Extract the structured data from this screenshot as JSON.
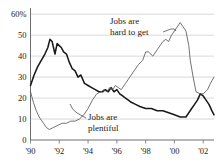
{
  "chart_data": {
    "type": "line",
    "title": "",
    "subtitle": "",
    "xlabel": "",
    "ylabel": "",
    "xlim": [
      1990,
      2002.75
    ],
    "ylim": [
      0,
      62
    ],
    "grid": true,
    "grid_axis": "y",
    "legend_position": "inline-annotations",
    "ytick_labels": [
      "60%",
      "50",
      "40",
      "30",
      "20",
      "10",
      "0"
    ],
    "ytick_values": [
      60,
      50,
      40,
      30,
      20,
      10,
      0
    ],
    "xtick_labels": [
      "'90",
      "'92",
      "'94",
      "'96",
      "'98",
      "'00",
      "'02"
    ],
    "xtick_values": [
      1990,
      1992,
      1994,
      1996,
      1998,
      2000,
      2002
    ],
    "annotations": [
      {
        "id": "hard-to-get",
        "text_line1": "Jobs are",
        "text_line2": "hard to get",
        "points_to_series": "Jobs are hard to get"
      },
      {
        "id": "plentiful",
        "text_line1": "Jobs are",
        "text_line2": "plentiful",
        "points_to_series": "Jobs are plentiful"
      }
    ],
    "series": [
      {
        "name": "Jobs are hard to get",
        "style": "bold",
        "color": "#1a1a1a",
        "x": [
          1990.0,
          1990.25,
          1990.5,
          1990.75,
          1991.0,
          1991.2,
          1991.35,
          1991.5,
          1991.7,
          1991.85,
          1992.0,
          1992.15,
          1992.3,
          1992.5,
          1992.7,
          1992.9,
          1993.1,
          1993.3,
          1993.5,
          1993.75,
          1994.0,
          1994.25,
          1994.5,
          1994.75,
          1995.0,
          1995.2,
          1995.4,
          1995.6,
          1995.8,
          1996.0,
          1996.2,
          1996.4,
          1996.6,
          1996.8,
          1997.0,
          1997.3,
          1997.6,
          1998.0,
          1998.4,
          1998.8,
          1999.2,
          1999.6,
          2000.0,
          2000.4,
          2000.8,
          2001.0,
          2001.2,
          2001.4,
          2001.6,
          2001.8,
          2002.0,
          2002.2,
          2002.4,
          2002.6,
          2002.75
        ],
        "y": [
          26,
          31,
          35,
          38,
          41,
          44,
          48,
          47,
          41,
          46,
          45,
          44,
          42,
          41,
          37,
          34,
          33,
          30,
          31,
          27,
          26,
          25,
          24,
          23,
          23,
          24,
          23,
          25,
          23,
          24,
          22,
          21,
          20,
          19,
          18,
          17,
          16,
          15,
          15,
          14,
          14,
          13,
          12,
          11,
          11,
          13,
          15,
          17,
          19,
          22,
          21,
          19,
          17,
          14,
          12
        ]
      },
      {
        "name": "Jobs are plentiful",
        "style": "thin",
        "color": "#5a5a5a",
        "x": [
          1990.0,
          1990.2,
          1990.4,
          1990.6,
          1990.9,
          1991.1,
          1991.3,
          1991.6,
          1991.9,
          1992.2,
          1992.5,
          1992.8,
          1993.1,
          1993.4,
          1993.7,
          1994.0,
          1994.3,
          1994.6,
          1994.9,
          1995.1,
          1995.3,
          1995.5,
          1995.7,
          1995.9,
          1996.1,
          1996.3,
          1996.6,
          1996.9,
          1997.2,
          1997.5,
          1997.8,
          1998.0,
          1998.2,
          1998.5,
          1998.8,
          1999.0,
          1999.2,
          1999.4,
          1999.6,
          1999.8,
          2000.0,
          2000.2,
          2000.4,
          2000.6,
          2000.8,
          2001.0,
          2001.1,
          2001.3,
          2001.5,
          2001.8,
          2002.0,
          2002.3,
          2002.5,
          2002.75
        ],
        "y": [
          23,
          18,
          14,
          11,
          8,
          6,
          5,
          6,
          7,
          8,
          8,
          9,
          9,
          10,
          12,
          15,
          19,
          22,
          23,
          24,
          23,
          25,
          24,
          26,
          25,
          24,
          27,
          30,
          33,
          36,
          38,
          42,
          42,
          40,
          43,
          45,
          47,
          48,
          47,
          50,
          52,
          54,
          56,
          54,
          52,
          45,
          38,
          30,
          23,
          22,
          22,
          24,
          27,
          30
        ]
      }
    ]
  }
}
